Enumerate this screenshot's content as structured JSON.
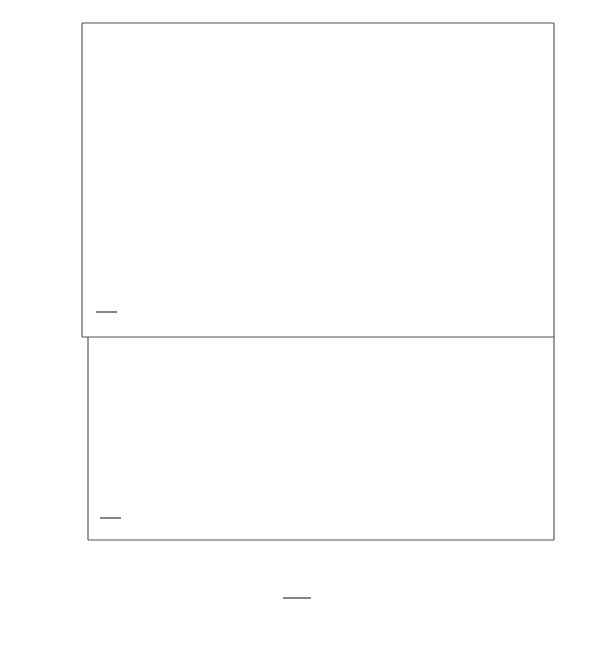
{
  "chart_data": [
    {
      "type": "line",
      "panel": "top",
      "title": "",
      "ratio_label": {
        "numerator": "μ1",
        "denominator": "μ2",
        "value": "10"
      },
      "xlabel": "W_i / d_1",
      "ylabel": "F",
      "xlim": [
        2,
        84
      ],
      "ylim": [
        0.817,
        1.908
      ],
      "yticks": [
        {
          "value": 1.5,
          "label": "1·5"
        },
        {
          "value": 1.0,
          "label": "1·0"
        }
      ],
      "yminor": [
        1.8,
        1.7,
        1.6,
        1.4,
        1.3,
        1.2,
        1.1,
        0.9
      ],
      "grid": false,
      "annotation": "∞",
      "series": [
        {
          "name": "n=7·0",
          "label": "n=7·0",
          "x": [
            2.2,
            3.5,
            5,
            7,
            10,
            13,
            17,
            22,
            27,
            35,
            45,
            60,
            84
          ],
          "y": [
            1.4,
            1.37,
            1.36,
            1.39,
            1.47,
            1.56,
            1.64,
            1.71,
            1.75,
            1.79,
            1.8,
            1.8,
            1.8
          ]
        },
        {
          "name": "6·0",
          "label": "6·0",
          "x": [
            2.2,
            3.5,
            5,
            7,
            10,
            13,
            17,
            22,
            28,
            35,
            45,
            60,
            84
          ],
          "y": [
            1.39,
            1.36,
            1.36,
            1.39,
            1.45,
            1.5,
            1.54,
            1.57,
            1.59,
            1.6,
            1.6,
            1.6,
            1.61
          ]
        },
        {
          "name": "5·0",
          "label": "5·0",
          "x": [
            2.2,
            3.5,
            5,
            6.5,
            9,
            12,
            16,
            20,
            25,
            35,
            50,
            84
          ],
          "y": [
            1.38,
            1.35,
            1.34,
            1.34,
            1.37,
            1.39,
            1.41,
            1.415,
            1.42,
            1.42,
            1.42,
            1.42
          ]
        },
        {
          "name": "4·0",
          "label": "4·0",
          "x": [
            2.2,
            4,
            7,
            10,
            14,
            18,
            22,
            30,
            45,
            84
          ],
          "y": [
            1.33,
            1.3,
            1.27,
            1.25,
            1.235,
            1.228,
            1.225,
            1.225,
            1.225,
            1.225
          ]
        },
        {
          "name": "3·0",
          "label": "3·0",
          "x": [
            2.2,
            3,
            5,
            8,
            12,
            16,
            20,
            25,
            30,
            40,
            84
          ],
          "y": [
            1.25,
            1.21,
            1.16,
            1.12,
            1.09,
            1.07,
            1.058,
            1.05,
            1.047,
            1.046,
            1.046
          ]
        },
        {
          "name": "2·0",
          "label": "2·0",
          "x": [
            2.2,
            3,
            4.5,
            6.5,
            9,
            12,
            16,
            20,
            26,
            35,
            50,
            84
          ],
          "y": [
            1.2,
            1.15,
            1.08,
            1.02,
            0.96,
            0.92,
            0.895,
            0.88,
            0.873,
            0.868,
            0.866,
            0.866
          ]
        },
        {
          "name": "∞",
          "label": "∞",
          "x": [
            3.5,
            4.5,
            5.5,
            6.2
          ],
          "y": [
            1.35,
            1.39,
            1.44,
            1.49
          ]
        }
      ]
    },
    {
      "type": "line",
      "panel": "bottom",
      "title": "",
      "ratio_label": {
        "numerator": "μ1",
        "denominator": "μ2",
        "value": "100"
      },
      "xlabel": "W_i / d_1",
      "ylabel": "F",
      "xlim": [
        3,
        84
      ],
      "ylim": [
        0.202,
        0.436
      ],
      "xticks": [
        10,
        20,
        30,
        40,
        50,
        60,
        70,
        80
      ],
      "yticks": [
        {
          "value": 0.4,
          "label": "0·4"
        },
        {
          "value": 0.3,
          "label": "0·3"
        }
      ],
      "grid": false,
      "annotation": "∞",
      "series": [
        {
          "name": "18·0",
          "label": "18·0",
          "x": [
            8.6,
            10.5,
            12.5,
            15,
            17,
            19,
            22,
            26,
            30,
            35,
            40,
            50,
            60,
            70,
            84
          ],
          "y": [
            0.355,
            0.333,
            0.32,
            0.316,
            0.317,
            0.322,
            0.333,
            0.348,
            0.362,
            0.378,
            0.388,
            0.395,
            0.397,
            0.398,
            0.4
          ]
        },
        {
          "name": "16·0",
          "label": "16·0",
          "x": [
            8.6,
            10.5,
            12.5,
            15,
            17,
            20,
            24,
            30,
            40,
            50,
            60,
            84
          ],
          "y": [
            0.355,
            0.331,
            0.316,
            0.31,
            0.311,
            0.317,
            0.33,
            0.342,
            0.354,
            0.36,
            0.361,
            0.362
          ]
        },
        {
          "name": "14·0",
          "label": "14·0",
          "x": [
            8.6,
            10.5,
            12.5,
            15,
            18,
            21,
            25,
            30,
            40,
            50,
            84
          ],
          "y": [
            0.355,
            0.33,
            0.312,
            0.304,
            0.302,
            0.306,
            0.313,
            0.319,
            0.324,
            0.326,
            0.326
          ]
        },
        {
          "name": "12·0",
          "label": "12·0",
          "x": [
            8.6,
            10.5,
            12.5,
            15,
            18,
            21,
            25,
            84
          ],
          "y": [
            0.355,
            0.328,
            0.308,
            0.297,
            0.291,
            0.289,
            0.289,
            0.289
          ]
        },
        {
          "name": "10·0",
          "label": "10·0",
          "x": [
            8.6,
            10.5,
            12.5,
            15,
            18,
            21,
            25,
            30,
            40,
            84
          ],
          "y": [
            0.355,
            0.325,
            0.302,
            0.283,
            0.268,
            0.259,
            0.253,
            0.251,
            0.25,
            0.25
          ]
        },
        {
          "name": "∞",
          "label": "∞",
          "x": [
            13,
            15,
            17,
            18.5
          ],
          "y": [
            0.313,
            0.312,
            0.316,
            0.322
          ]
        }
      ]
    }
  ],
  "labels": {
    "y_axis_top": "F",
    "y_axis_bottom": "F",
    "x_numerator": "W",
    "x_numerator_sub": "i",
    "x_denominator": "d",
    "x_denominator_sub": "1",
    "infinity": "∞",
    "mu_num": "μ",
    "mu_num_sub": "1",
    "mu_den": "μ",
    "mu_den_sub": "2",
    "top_ratio_value": "10",
    "bottom_ratio_value": "100",
    "top_series_labels": [
      "n=7·0",
      "6·0",
      "5·0",
      "4·0",
      "3·0",
      "2·0"
    ],
    "bottom_series_labels": [
      "18·0",
      "16·0",
      "14·0",
      "12·0",
      "10·0"
    ],
    "top_yticks": [
      "1·5",
      "1·0"
    ],
    "bottom_yticks": [
      "0·4",
      "0·3"
    ],
    "xticks": [
      "10",
      "20",
      "30",
      "40",
      "50",
      "60",
      "70",
      "80"
    ]
  }
}
